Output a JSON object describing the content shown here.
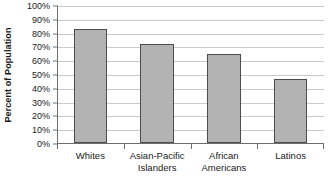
{
  "chart_data": {
    "type": "bar",
    "title": "",
    "subtitle": "",
    "xlabel": "",
    "ylabel": "Percent of Population",
    "categories": [
      "Whites",
      "Asian-Pacific Islanders",
      "African Americans",
      "Latinos"
    ],
    "category_label_lines": [
      [
        "Whites"
      ],
      [
        "Asian-Pacific",
        "Islanders"
      ],
      [
        "African",
        "Americans"
      ],
      [
        "Latinos"
      ]
    ],
    "values": [
      82.5,
      71.5,
      64.5,
      46.5
    ],
    "value_unit": "%",
    "ylim": [
      0,
      100
    ],
    "y_tick_values": [
      0,
      10,
      20,
      30,
      40,
      50,
      60,
      70,
      80,
      90,
      100
    ],
    "y_tick_labels": [
      "0%",
      "10%",
      "20%",
      "30%",
      "40%",
      "50%",
      "60%",
      "70%",
      "80%",
      "90%",
      "100%"
    ],
    "grid": true,
    "grid_axis": "y",
    "legend": false,
    "legend_position": "none",
    "orientation": "vertical",
    "series": [
      {
        "name": "Percent of Population",
        "values": [
          82.5,
          71.5,
          64.5,
          46.5
        ]
      }
    ]
  },
  "style": {
    "bar_fill": "#b3b3b3",
    "bar_border": "#4d4d4d",
    "gridline_color": "#c9c9c9",
    "axis_color": "#6e6e6e",
    "text_color": "#1a1a1a",
    "background": "#ffffff"
  }
}
